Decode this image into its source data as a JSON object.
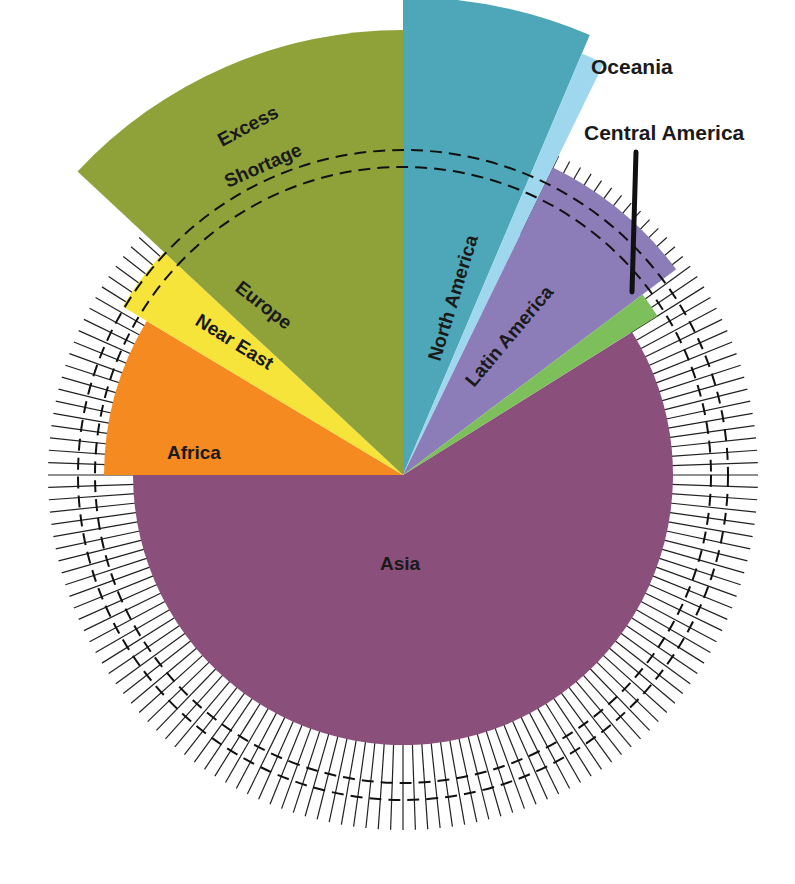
{
  "chart_data": {
    "type": "polar-area",
    "title": "",
    "center": [
      403,
      475
    ],
    "reference_circle": {
      "label_outer": "Excess",
      "label_inner": "Shortage",
      "radius": 308
    },
    "inner_dashed_radius": 325,
    "tick_ring": {
      "inner_radius": 270,
      "outer_radius": 355,
      "count": 180
    },
    "sectors": [
      {
        "name": "Asia",
        "start_deg": -32,
        "end_deg": 180,
        "radius": 270,
        "color": "#8b4f7c"
      },
      {
        "name": "Africa",
        "start_deg": 180,
        "end_deg": 211,
        "radius": 299,
        "color": "#f58a20"
      },
      {
        "name": "Near East",
        "start_deg": 211,
        "end_deg": 223,
        "radius": 327,
        "color": "#f7e43a"
      },
      {
        "name": "Europe",
        "start_deg": 223,
        "end_deg": 270,
        "radius": 445,
        "color": "#8fa23a"
      },
      {
        "name": "North America",
        "start_deg": 270,
        "end_deg": 293,
        "radius": 478,
        "color": "#4ea7b8"
      },
      {
        "name": "Oceania",
        "start_deg": 293,
        "end_deg": 296,
        "radius": 458,
        "color": "#9fd8ee"
      },
      {
        "name": "Latin America",
        "start_deg": 296,
        "end_deg": 323,
        "radius": 342,
        "color": "#8c7cb8"
      },
      {
        "name": "Central America",
        "start_deg": 323,
        "end_deg": 328,
        "radius": 300,
        "color": "#7dbf5a"
      }
    ],
    "labels": {
      "asia": "Asia",
      "africa": "Africa",
      "near_east": "Near East",
      "europe": "Europe",
      "north_america": "North America",
      "oceania": "Oceania",
      "latin_america": "Latin America",
      "central_america": "Central America",
      "excess": "Excess",
      "shortage": "Shortage"
    }
  }
}
